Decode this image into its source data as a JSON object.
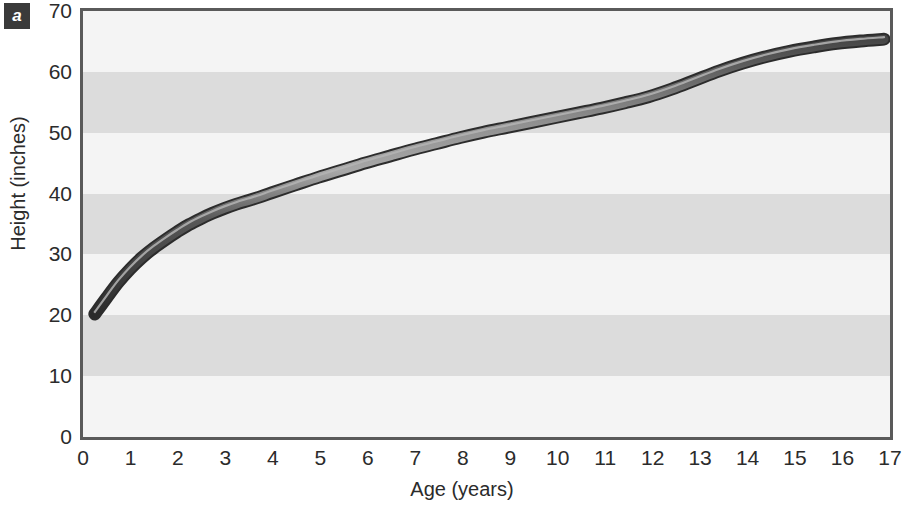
{
  "panel": {
    "letter": "a"
  },
  "colors": {
    "curve_dark": "#3b3b3b",
    "curve_core": "#2c2c2c",
    "curve_highlight": "#9a9a9a",
    "band_light": "#f4f4f4",
    "band_dark": "#dcdcdc",
    "frame": "#5a5a5a",
    "text": "#2b2b2b",
    "badge_bg": "#3a3a3a",
    "badge_text": "#ffffff"
  },
  "chart_data": {
    "type": "line",
    "title": "",
    "subtitle": "",
    "xlabel": "Age  (years)",
    "ylabel": "Height (inches)",
    "xlim": [
      0,
      17
    ],
    "ylim": [
      0,
      70
    ],
    "xticks": [
      0,
      1,
      2,
      3,
      4,
      5,
      6,
      7,
      8,
      9,
      10,
      11,
      12,
      13,
      14,
      15,
      16,
      17
    ],
    "yticks": [
      0,
      10,
      20,
      30,
      40,
      50,
      60,
      70
    ],
    "xtick_labels": [
      "0",
      "1",
      "2",
      "3",
      "4",
      "5",
      "6",
      "7",
      "8",
      "9",
      "10",
      "11",
      "12",
      "13",
      "14",
      "15",
      "16",
      "17"
    ],
    "ytick_labels": [
      "0",
      "10",
      "20",
      "30",
      "40",
      "50",
      "60",
      "70"
    ],
    "grid": false,
    "banded_background": true,
    "band_interval": 10,
    "legend": null,
    "legend_position": "none",
    "annotations": [],
    "series": [
      {
        "name": "Height",
        "x": [
          0.25,
          0.5,
          0.75,
          1,
          1.25,
          1.5,
          1.75,
          2,
          2.25,
          2.5,
          2.75,
          3,
          3.25,
          3.5,
          3.75,
          4,
          4.5,
          5,
          5.5,
          6,
          6.5,
          7,
          7.5,
          8,
          8.5,
          9,
          9.5,
          10,
          10.5,
          11,
          11.5,
          12,
          12.5,
          13,
          13.5,
          14,
          14.5,
          15,
          15.5,
          16,
          16.5,
          17
        ],
        "y": [
          19.5,
          22.2,
          24.8,
          27.0,
          28.9,
          30.5,
          31.9,
          33.2,
          34.4,
          35.4,
          36.3,
          37.1,
          37.8,
          38.4,
          39.0,
          39.7,
          41.0,
          42.3,
          43.5,
          44.7,
          45.8,
          46.9,
          47.9,
          48.9,
          49.8,
          50.6,
          51.4,
          52.2,
          53.0,
          53.8,
          54.7,
          55.7,
          57.0,
          58.5,
          60.0,
          61.3,
          62.4,
          63.3,
          64.0,
          64.6,
          65.0,
          65.3
        ]
      }
    ]
  }
}
